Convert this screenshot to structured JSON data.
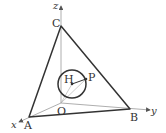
{
  "figure": {
    "axes": {
      "x_label": "x",
      "y_label": "y",
      "z_label": "z"
    },
    "points": {
      "O": {
        "label": "O",
        "px": [
          61,
          103
        ]
      },
      "A": {
        "label": "A",
        "px": [
          29,
          117
        ]
      },
      "B": {
        "label": "B",
        "px": [
          130,
          109
        ]
      },
      "C": {
        "label": "C",
        "px": [
          61,
          26
        ]
      },
      "H": {
        "label": "H",
        "px": [
          72,
          84
        ]
      },
      "P": {
        "label": "P",
        "px": [
          86,
          79
        ]
      }
    },
    "circle": {
      "center": "H",
      "radius_px": 14
    },
    "colors": {
      "stroke": "#333333",
      "thin_line": "#888888",
      "background": "#ffffff"
    }
  }
}
